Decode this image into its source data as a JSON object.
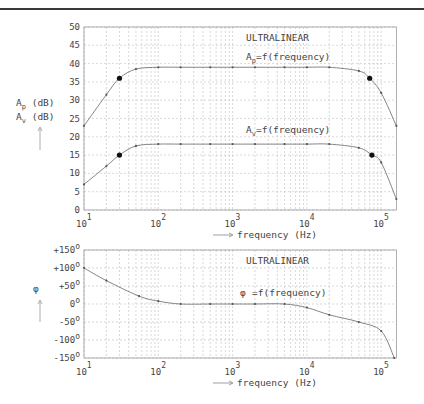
{
  "chart_data": [
    {
      "type": "line",
      "title": "ULTRALINEAR",
      "xlabel": "frequency (Hz)",
      "ylabel": "Ap (dB) / Av (dB)",
      "xscale": "log",
      "xlim": [
        10,
        160000
      ],
      "ylim": [
        0,
        50
      ],
      "x_tick_labels": [
        "10^1",
        "10^2",
        "10^3",
        "10^4",
        "10^5"
      ],
      "y_tick_labels": [
        "0",
        "5",
        "10",
        "15",
        "20",
        "25",
        "30",
        "35",
        "40",
        "45",
        "50"
      ],
      "grid": true,
      "annotations": [
        "ULTRALINEAR",
        "Ap=f(frequency)",
        "Av=f(frequency)"
      ],
      "series": [
        {
          "name": "Ap=f(frequency)",
          "x": [
            10,
            20,
            30,
            50,
            100,
            200,
            500,
            1000,
            2000,
            5000,
            10000,
            20000,
            50000,
            70000,
            100000,
            160000
          ],
          "values": [
            23,
            31.5,
            36,
            38.5,
            39,
            39,
            39,
            39,
            39,
            39,
            39,
            39,
            38,
            36,
            32,
            23
          ],
          "highlight_points": [
            [
              30,
              36
            ],
            [
              70000,
              36
            ]
          ]
        },
        {
          "name": "Av=f(frequency)",
          "x": [
            10,
            20,
            30,
            50,
            100,
            200,
            500,
            1000,
            2000,
            5000,
            10000,
            20000,
            50000,
            75000,
            100000,
            160000
          ],
          "values": [
            7,
            12,
            15,
            17.5,
            18,
            18,
            18,
            18,
            18,
            18,
            18,
            18,
            17,
            15,
            13,
            3
          ],
          "highlight_points": [
            [
              30,
              15
            ],
            [
              75000,
              15
            ]
          ]
        }
      ]
    },
    {
      "type": "line",
      "title": "ULTRALINEAR",
      "xlabel": "frequency (Hz)",
      "ylabel": "φ",
      "xscale": "log",
      "xlim": [
        10,
        160000
      ],
      "ylim": [
        -150,
        150
      ],
      "x_tick_labels": [
        "10^1",
        "10^2",
        "10^3",
        "10^4",
        "10^5"
      ],
      "y_tick_labels": [
        "+150°",
        "+100°",
        "+50°",
        "0°",
        "-50°",
        "-100°",
        "-150°"
      ],
      "grid": true,
      "annotations": [
        "ULTRALINEAR",
        "φ=f(frequency)"
      ],
      "series": [
        {
          "name": "φ=f(frequency)",
          "x": [
            10,
            20,
            55,
            100,
            200,
            500,
            1000,
            2000,
            5000,
            10000,
            20000,
            50000,
            100000,
            150000
          ],
          "values": [
            100,
            65,
            22,
            8,
            0,
            0,
            0,
            0,
            0,
            -10,
            -30,
            -50,
            -75,
            -150
          ]
        }
      ]
    }
  ],
  "labels": {
    "top_title": "ULTRALINEAR",
    "ap_curve": "Ap=f(frequency)",
    "av_curve": "Av=f(frequency)",
    "ap_axis": "Ap (dB)",
    "av_axis": "Av (dB)",
    "x_axis": "frequency  (Hz)",
    "bottom_title": "ULTRALINEAR",
    "phi_curve": "=f(frequency)",
    "phi_symbol": "φ"
  }
}
